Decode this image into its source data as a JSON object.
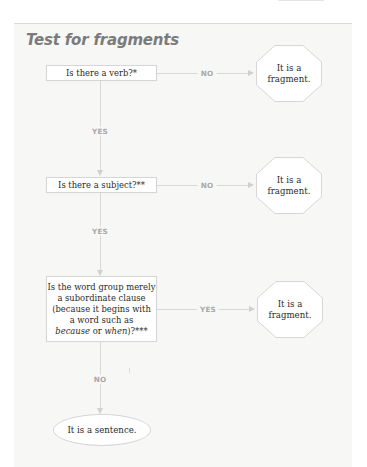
{
  "title": "Test for fragments",
  "nodes": {
    "q1": {
      "text": "Is there a verb?*"
    },
    "q2": {
      "text": "Is there a subject?**"
    },
    "q3": {
      "line1": "Is the word group merely",
      "line2": "a subordinate clause",
      "line3": "(because it begins with",
      "line4": "a word such as",
      "line5_italic1": "because",
      "line5_mid": " or ",
      "line5_italic2": "when",
      "line5_end": ")?***"
    },
    "r1": {
      "line1": "It is a",
      "line2": "fragment."
    },
    "r2": {
      "line1": "It is a",
      "line2": "fragment."
    },
    "r3": {
      "line1": "It is a",
      "line2": "fragment."
    },
    "end": {
      "text": "It is a sentence."
    }
  },
  "edges": {
    "q1_no": "NO",
    "q1_yes": "YES",
    "q2_no": "NO",
    "q2_yes": "YES",
    "q3_yes": "YES",
    "q3_no": "NO"
  },
  "colors": {
    "panel_bg": "#f7f7f6",
    "line": "#d8d8d8",
    "label": "#a8a8a8",
    "title": "#7b7b7b"
  }
}
